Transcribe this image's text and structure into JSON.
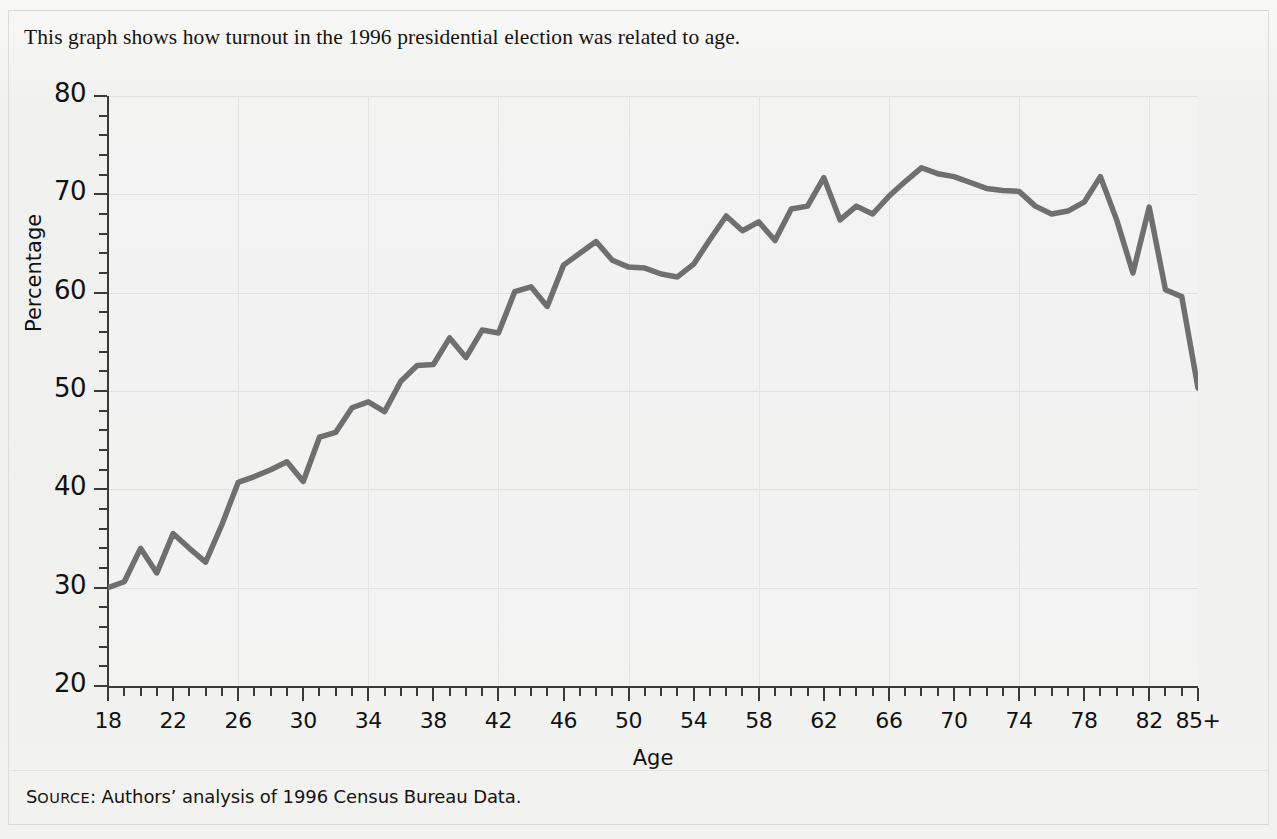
{
  "caption": "This graph shows how turnout in the 1996 presidential election was related to age.",
  "source": {
    "prefix": "Source",
    "colon": ":",
    "text": " Authors’ analysis of 1996 Census Bureau Data."
  },
  "colors": {
    "line": "#6f6f6f",
    "axis": "#3a3a3a",
    "grid": "#e0e0de",
    "background": "#f0f0ef",
    "text": "#111111"
  },
  "chart_data": {
    "type": "line",
    "title": "",
    "xlabel": "Age",
    "ylabel": "Percentage",
    "xlim": [
      18,
      85
    ],
    "ylim": [
      20,
      80
    ],
    "grid": true,
    "legend": "none",
    "y_major_ticks": [
      20,
      30,
      40,
      50,
      60,
      70,
      80
    ],
    "y_tick_labels": [
      "20",
      "30",
      "40",
      "50",
      "60",
      "70",
      "80"
    ],
    "y_minor_step": 2,
    "x_major_ticks": [
      18,
      22,
      26,
      30,
      34,
      38,
      42,
      46,
      50,
      54,
      58,
      62,
      66,
      70,
      74,
      78,
      82,
      85
    ],
    "x_tick_labels": [
      "18",
      "22",
      "26",
      "30",
      "34",
      "38",
      "42",
      "46",
      "50",
      "54",
      "58",
      "62",
      "66",
      "70",
      "74",
      "78",
      "82",
      "85+"
    ],
    "x_minor_step": 1,
    "series": [
      {
        "name": "Turnout",
        "x": [
          18,
          19,
          20,
          21,
          22,
          23,
          24,
          25,
          26,
          27,
          28,
          29,
          30,
          31,
          32,
          33,
          34,
          35,
          36,
          37,
          38,
          39,
          40,
          41,
          42,
          43,
          44,
          45,
          46,
          47,
          48,
          49,
          50,
          51,
          52,
          53,
          54,
          55,
          56,
          57,
          58,
          59,
          60,
          61,
          62,
          63,
          64,
          65,
          66,
          67,
          68,
          69,
          70,
          71,
          72,
          73,
          74,
          75,
          76,
          77,
          78,
          79,
          80,
          81,
          82,
          83,
          84,
          85
        ],
        "values": [
          30.0,
          30.6,
          34.0,
          31.5,
          35.5,
          34.0,
          32.6,
          36.4,
          40.7,
          41.3,
          42.0,
          42.8,
          40.8,
          45.3,
          45.8,
          48.3,
          48.9,
          47.9,
          51.0,
          52.6,
          52.7,
          55.4,
          53.4,
          56.2,
          55.9,
          60.1,
          60.6,
          58.6,
          62.8,
          64.0,
          65.2,
          63.3,
          62.6,
          62.5,
          61.9,
          61.6,
          62.9,
          65.4,
          67.8,
          66.3,
          67.2,
          65.3,
          68.5,
          68.8,
          71.7,
          67.4,
          68.8,
          68.0,
          69.8,
          71.3,
          72.7,
          72.1,
          71.8,
          71.2,
          70.6,
          70.4,
          70.3,
          68.8,
          68.0,
          68.3,
          69.2,
          71.8,
          67.4,
          62.0,
          68.7,
          60.3,
          59.6,
          50.3
        ]
      }
    ]
  }
}
